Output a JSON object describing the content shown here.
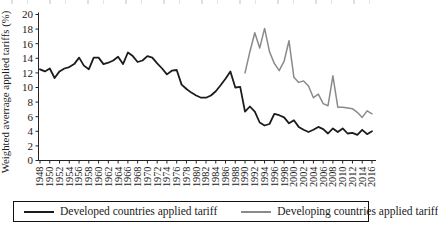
{
  "figure": {
    "note": "top edge shows the cropped bottom of a previous text line",
    "background_color": "#ffffff",
    "axis_color": "#222222"
  },
  "chart_data": {
    "type": "line",
    "title": "",
    "xlabel": "",
    "ylabel": "Weighted averrage applied tariffs (%)",
    "ylim": [
      0,
      20
    ],
    "ytick_step": 2,
    "yticks": [
      0,
      2,
      4,
      6,
      8,
      10,
      12,
      14,
      16,
      18,
      20
    ],
    "x_range": [
      1948,
      2016
    ],
    "xtick_step": 2,
    "xticks": [
      1948,
      1950,
      1952,
      1954,
      1956,
      1958,
      1960,
      1962,
      1964,
      1966,
      1968,
      1970,
      1972,
      1974,
      1976,
      1978,
      1980,
      1982,
      1984,
      1986,
      1988,
      1990,
      1992,
      1994,
      1996,
      1998,
      2000,
      2002,
      2004,
      2006,
      2008,
      2010,
      2012,
      2014,
      2016
    ],
    "grid": false,
    "legend_position": "bottom-boxed",
    "series": [
      {
        "name": "Developed countries applied tariff",
        "color": "#1c1c1c",
        "stroke_width": 1.8,
        "x_start": 1948,
        "values": [
          12.5,
          12.2,
          12.6,
          11.3,
          12.2,
          12.6,
          12.8,
          13.2,
          14.1,
          13.0,
          12.5,
          14.1,
          14.1,
          13.2,
          13.4,
          13.7,
          14.2,
          13.2,
          14.8,
          14.3,
          13.5,
          13.7,
          14.3,
          14.1,
          13.3,
          12.6,
          11.8,
          12.3,
          12.4,
          10.4,
          9.8,
          9.3,
          8.9,
          8.6,
          8.6,
          8.9,
          9.5,
          10.3,
          11.2,
          12.2,
          10.0,
          10.1,
          6.7,
          7.4,
          6.7,
          5.2,
          4.8,
          5.0,
          6.4,
          6.2,
          5.9,
          5.1,
          5.5,
          4.6,
          4.2,
          3.9,
          4.2,
          4.6,
          4.3,
          3.7,
          4.4,
          3.9,
          4.4,
          3.7,
          3.8,
          3.5,
          4.2,
          3.6,
          4.0
        ]
      },
      {
        "name": "Developing countries applied tariff",
        "color": "#8a8a8a",
        "stroke_width": 1.5,
        "x_start": 1990,
        "values": [
          12.0,
          14.9,
          17.5,
          15.4,
          18.1,
          14.9,
          13.3,
          12.3,
          13.6,
          16.4,
          11.4,
          10.7,
          10.9,
          10.2,
          8.6,
          9.1,
          7.8,
          7.5,
          11.6,
          7.3,
          7.3,
          7.2,
          7.1,
          6.6,
          5.9,
          6.8,
          6.4
        ]
      }
    ]
  },
  "legend": {
    "items": [
      {
        "label": "Developed countries applied tariff",
        "color": "#1c1c1c"
      },
      {
        "label": "Developing countries applied tariff",
        "color": "#8a8a8a"
      }
    ]
  }
}
